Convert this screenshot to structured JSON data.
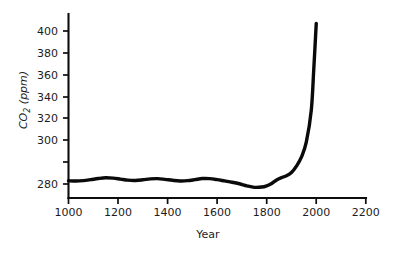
{
  "chart_data": {
    "type": "line",
    "title": "",
    "xlabel": "Year",
    "ylabel": "CO2 (ppm)",
    "ylabel_parts": {
      "prefix": "CO",
      "subscript": "2",
      "suffix": " (ppm)"
    },
    "xlim": [
      1000,
      2200
    ],
    "ylim": [
      270,
      410
    ],
    "xticks": [
      1000,
      1200,
      1400,
      1600,
      1800,
      2000,
      2200
    ],
    "xtick_labels": [
      "1000",
      "1200",
      "1400",
      "1600",
      "1800",
      "2000",
      "2200"
    ],
    "yticks": [
      280,
      300,
      320,
      340,
      360,
      380,
      400
    ],
    "ytick_labels": [
      "280",
      "300",
      "320",
      "340",
      "360",
      "380",
      "400"
    ],
    "grid": false,
    "legend": null,
    "line_color": "#0a0a0a",
    "background_color": "#ffffff",
    "series": [
      {
        "name": "Atmospheric CO2 concentration",
        "x": [
          1000,
          1030,
          1060,
          1090,
          1120,
          1150,
          1180,
          1210,
          1240,
          1270,
          1300,
          1330,
          1360,
          1390,
          1420,
          1450,
          1480,
          1510,
          1540,
          1570,
          1600,
          1630,
          1660,
          1690,
          1720,
          1750,
          1780,
          1800,
          1820,
          1840,
          1860,
          1880,
          1900,
          1920,
          1940,
          1960,
          1980,
          1990,
          2000
        ],
        "y": [
          282.5,
          282.3,
          282.6,
          283.4,
          284.3,
          284.9,
          284.6,
          283.8,
          283.0,
          282.8,
          283.3,
          284.0,
          284.2,
          283.6,
          282.9,
          282.4,
          282.6,
          283.4,
          284.3,
          284.2,
          283.4,
          282.4,
          281.4,
          280.2,
          278.6,
          277.4,
          277.6,
          278.6,
          280.4,
          283.2,
          285.0,
          286.4,
          289.0,
          294.0,
          301.0,
          313.0,
          338.0,
          370.0,
          406.0
        ]
      }
    ]
  },
  "axes": {
    "y_axis_name": "y-axis",
    "x_axis_name": "x-axis"
  }
}
